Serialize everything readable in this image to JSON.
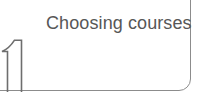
{
  "card": {
    "title": "Choosing courses",
    "step_number": "1",
    "frame_color": "#8c8c8c",
    "title_color": "#575757",
    "number_outline_color": "#6e6e6e",
    "background_color": "#ffffff"
  }
}
